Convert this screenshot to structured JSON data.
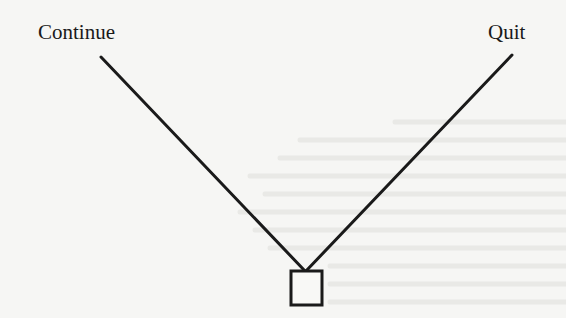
{
  "diagram": {
    "type": "decision-tree",
    "root_node": {
      "shape": "square"
    },
    "branches": [
      {
        "label": "Continue"
      },
      {
        "label": "Quit"
      }
    ]
  },
  "colors": {
    "ink": "#1a1a1a",
    "paper": "#f6f6f4"
  }
}
